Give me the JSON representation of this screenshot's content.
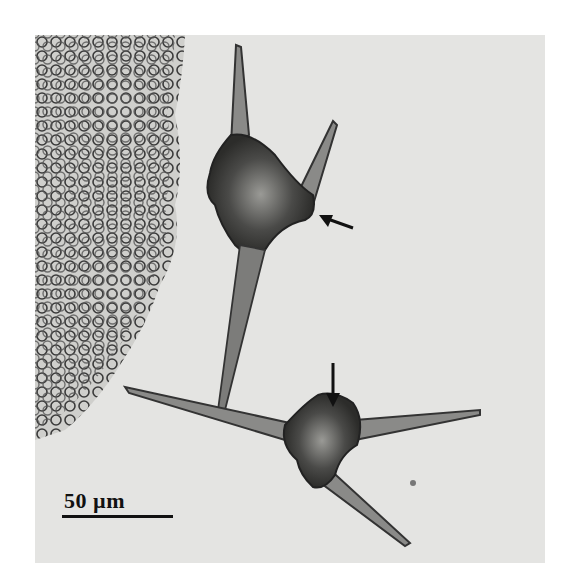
{
  "figure": {
    "scale_bar": {
      "label": "50 µm",
      "length_px": 111
    },
    "annotations": [
      {
        "type": "arrow",
        "direction": "left",
        "position": "right side of upper cell"
      },
      {
        "type": "arrow",
        "direction": "down",
        "position": "top of lower cell"
      }
    ],
    "colors": {
      "background": "#e4e4e2",
      "cell_dark": "#2a2a2a",
      "cell_mid": "#7a7a78",
      "page": "#ffffff"
    }
  }
}
